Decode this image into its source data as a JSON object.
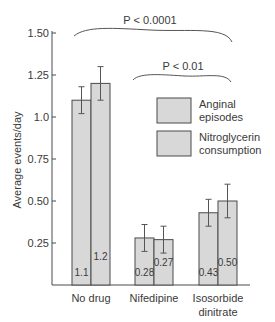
{
  "chart_data": {
    "type": "bar",
    "title": "",
    "xlabel": "",
    "ylabel": "Average events/day",
    "ylim": [
      0,
      1.5
    ],
    "yticks": [
      "0.25",
      "0.50",
      "0.75",
      "1.0",
      "1.25",
      "1.50"
    ],
    "ytick_values": [
      0.25,
      0.5,
      0.75,
      1.0,
      1.25,
      1.5
    ],
    "grid": false,
    "legend_position": "upper right",
    "categories": [
      "No drug",
      "Nifedipine",
      "Isosorbide dinitrate"
    ],
    "category_lines": [
      [
        "No drug"
      ],
      [
        "Nifedipine"
      ],
      [
        "Isosorbide",
        "dinitrate"
      ]
    ],
    "series": [
      {
        "name": "Anginal episodes",
        "values": [
          1.1,
          0.28,
          0.43
        ],
        "labels": [
          "1.1",
          "0.28",
          "0.43"
        ],
        "error": [
          0.08,
          0.08,
          0.08
        ]
      },
      {
        "name": "Nitroglycerin consumption",
        "values": [
          1.2,
          0.27,
          0.5
        ],
        "labels": [
          "1.2",
          "0.27",
          "0.50"
        ],
        "error": [
          0.1,
          0.08,
          0.1
        ]
      }
    ],
    "legend": [
      {
        "lines": [
          "Anginal",
          "episodes"
        ]
      },
      {
        "lines": [
          "Nitroglycerin",
          "consumption"
        ]
      }
    ],
    "annotations": [
      {
        "text": "P < 0.0001",
        "spans": [
          "No drug",
          "Isosorbide dinitrate"
        ]
      },
      {
        "text": "P < 0.01",
        "spans": [
          "Nifedipine",
          "Isosorbide dinitrate"
        ]
      }
    ],
    "colors": {
      "bar_fill": "#d8d8d8",
      "bar_stroke": "#4a4a4a",
      "axis": "#4a4a4a",
      "text": "#3a3a3a"
    }
  }
}
